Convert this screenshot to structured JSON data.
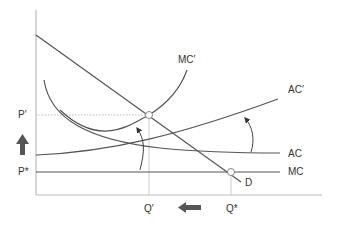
{
  "diagram": {
    "type": "economics-cost-curves",
    "axes": {
      "x_label": "",
      "y_label": ""
    },
    "price_labels": {
      "p_prime": "P′",
      "p_star": "P*"
    },
    "quantity_labels": {
      "q_prime": "Q′",
      "q_star": "Q*"
    },
    "curve_labels": {
      "mc_prime": "MC′",
      "ac_prime": "AC′",
      "ac": "AC",
      "mc": "MC",
      "demand": "D"
    },
    "equilibrium_markers": {
      "new": "A",
      "old": "A"
    },
    "annotations": {
      "price_shift": "up-arrow",
      "quantity_shift": "left-arrow"
    },
    "colors": {
      "line": "#555555",
      "guide": "#bbbbbb",
      "arrow": "#444444",
      "text": "#333333"
    }
  }
}
